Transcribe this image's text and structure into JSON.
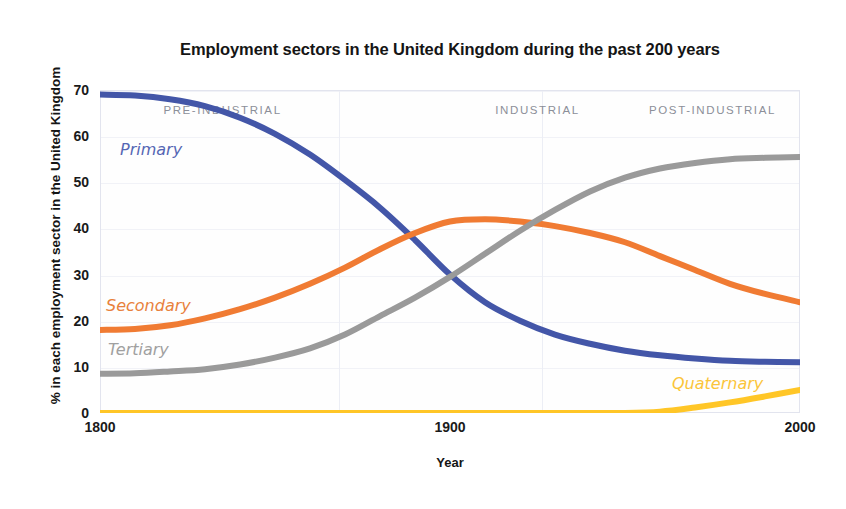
{
  "chart_data": {
    "type": "line",
    "title": "Employment sectors in the United Kingdom during the past 200 years",
    "xlabel": "Year",
    "ylabel": "% in each employment sector in the United Kingdom",
    "xlim": [
      1800,
      2000
    ],
    "ylim": [
      0,
      70
    ],
    "xticks": [
      "1800",
      "1900",
      "2000"
    ],
    "yticks": [
      "0",
      "10",
      "20",
      "30",
      "40",
      "50",
      "60",
      "70"
    ],
    "grid": true,
    "legend_position": "inline-labels",
    "annotations": [
      {
        "text": "PRE-INDUSTRIAL",
        "x": 1835
      },
      {
        "text": "INDUSTRIAL",
        "x": 1925
      },
      {
        "text": "POST-INDUSTRIAL",
        "x": 1975
      }
    ],
    "x": [
      1800,
      1810,
      1820,
      1830,
      1840,
      1850,
      1860,
      1870,
      1880,
      1890,
      1900,
      1910,
      1920,
      1930,
      1940,
      1950,
      1960,
      1970,
      1980,
      1990,
      2000
    ],
    "series": [
      {
        "name": "Primary",
        "color": "#4356A8",
        "values": [
          69,
          68.8,
          68,
          66.5,
          64,
          60.5,
          56,
          50.5,
          44.5,
          37.5,
          30,
          24,
          20,
          17,
          15,
          13.5,
          12.5,
          11.8,
          11.3,
          11.1,
          11
        ]
      },
      {
        "name": "Secondary",
        "color": "#F07B33",
        "values": [
          18,
          18.2,
          19,
          20.5,
          22.5,
          25,
          28,
          31.5,
          35.5,
          39,
          41.5,
          42,
          41.5,
          40.5,
          39,
          37,
          34,
          31,
          28,
          25.8,
          24
        ]
      },
      {
        "name": "Tertiary",
        "color": "#9A9A9A",
        "values": [
          8.5,
          8.6,
          9,
          9.5,
          10.5,
          12,
          14,
          17,
          21,
          25,
          29.5,
          34.5,
          39.5,
          44,
          48,
          51,
          53,
          54.2,
          55,
          55.3,
          55.5
        ]
      },
      {
        "name": "Quaternary",
        "color": "#FFC627",
        "values": [
          0,
          0,
          0,
          0,
          0,
          0,
          0,
          0,
          0,
          0,
          0,
          0,
          0,
          0,
          0,
          0,
          0.3,
          1.2,
          2.3,
          3.6,
          5
        ]
      }
    ]
  },
  "series_labels": [
    {
      "name": "Primary",
      "color": "#5566B4",
      "x": 120,
      "y": 140
    },
    {
      "name": "Secondary",
      "color": "#E8813C",
      "x": 106,
      "y": 296
    },
    {
      "name": "Tertiary",
      "color": "#A0A0A0",
      "x": 108,
      "y": 340
    },
    {
      "name": "Quaternary",
      "color": "#FBC53A",
      "x": 672,
      "y": 374
    }
  ]
}
